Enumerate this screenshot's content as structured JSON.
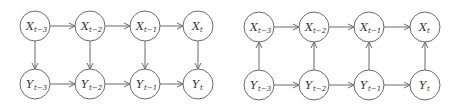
{
  "diagrams": [
    {
      "name": "left-diagram",
      "direction": "X-to-Y",
      "top_row": [
        {
          "var": "X",
          "sub": "t−3"
        },
        {
          "var": "X",
          "sub": "t−2"
        },
        {
          "var": "X",
          "sub": "t−1"
        },
        {
          "var": "X",
          "sub": "t"
        }
      ],
      "bottom_row": [
        {
          "var": "Y",
          "sub": "t−3"
        },
        {
          "var": "Y",
          "sub": "t−2"
        },
        {
          "var": "Y",
          "sub": "t−1"
        },
        {
          "var": "Y",
          "sub": "t"
        }
      ]
    },
    {
      "name": "right-diagram",
      "direction": "Y-to-X",
      "top_row": [
        {
          "var": "X",
          "sub": "t−3"
        },
        {
          "var": "X",
          "sub": "t−2"
        },
        {
          "var": "X",
          "sub": "t−1"
        },
        {
          "var": "X",
          "sub": "t"
        }
      ],
      "bottom_row": [
        {
          "var": "Y",
          "sub": "t−3"
        },
        {
          "var": "Y",
          "sub": "t−2"
        },
        {
          "var": "Y",
          "sub": "t−1"
        },
        {
          "var": "Y",
          "sub": "t"
        }
      ]
    }
  ],
  "colors": {
    "stroke": "#6b6b6b",
    "text": "#333333"
  }
}
